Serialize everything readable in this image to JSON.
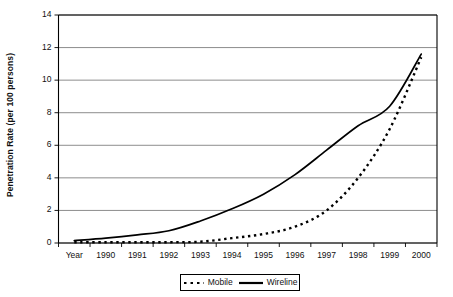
{
  "chart_data": {
    "type": "line",
    "title": "",
    "xlabel": "",
    "ylabel": "Penetration Rate (per 100 persons)",
    "categories": [
      "Year",
      "1990",
      "1991",
      "1992",
      "1993",
      "1994",
      "1995",
      "1996",
      "1997",
      "1998",
      "1999",
      "2000"
    ],
    "ylim": [
      0,
      14
    ],
    "yticks": [
      0,
      2,
      4,
      6,
      8,
      10,
      12,
      14
    ],
    "grid": true,
    "legend_position": "bottom",
    "series": [
      {
        "name": "Mobile",
        "style": "dotted",
        "color": "#000000",
        "values": [
          0.05,
          0.05,
          0.05,
          0.05,
          0.08,
          0.3,
          0.55,
          1.0,
          2.0,
          4.0,
          7.0,
          11.4
        ]
      },
      {
        "name": "Wireline",
        "style": "solid",
        "color": "#000000",
        "values": [
          0.15,
          0.3,
          0.5,
          0.75,
          1.35,
          2.1,
          3.0,
          4.2,
          5.7,
          7.2,
          8.4,
          11.6
        ]
      }
    ]
  },
  "axes": {
    "y_tick_labels": [
      "14",
      "12",
      "10",
      "8",
      "6",
      "4",
      "2",
      "0"
    ],
    "x_tick_labels": [
      "Year",
      "1990",
      "1991",
      "1992",
      "1993",
      "1994",
      "1995",
      "1996",
      "1997",
      "1998",
      "1999",
      "2000"
    ],
    "y_axis_title": "Penetration Rate (per 100 persons)"
  },
  "legend": {
    "mobile_label": "Mobile",
    "wireline_label": "Wireline"
  },
  "colors": {
    "axis": "#000000",
    "grid": "#808080",
    "series": "#000000",
    "background": "#ffffff"
  }
}
